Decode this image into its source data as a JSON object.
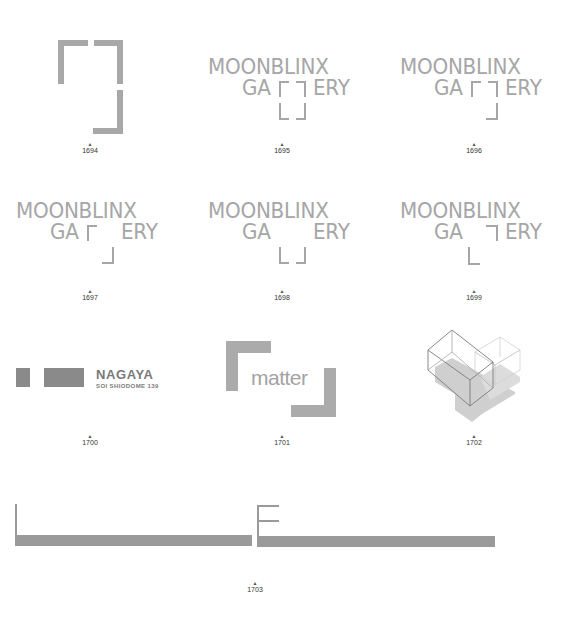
{
  "logos": [
    {
      "id": "1694",
      "caption": "1694",
      "kind": "bracket-frame"
    },
    {
      "id": "1695",
      "caption": "1695",
      "kind": "moonblinx",
      "line1": "MOONBLINX",
      "line2_left": "GA",
      "line2_right": "ERY"
    },
    {
      "id": "1696",
      "caption": "1696",
      "kind": "moonblinx",
      "line1": "MOONBLINX",
      "line2_left": "GA",
      "line2_right": "ERY"
    },
    {
      "id": "1697",
      "caption": "1697",
      "kind": "moonblinx",
      "line1": "MOONBLINX",
      "line2_left": "GA",
      "line2_right": "ERY"
    },
    {
      "id": "1698",
      "caption": "1698",
      "kind": "moonblinx",
      "line1": "MOONBLINX",
      "line2_left": "GA",
      "line2_right": "ERY"
    },
    {
      "id": "1699",
      "caption": "1699",
      "kind": "moonblinx",
      "line1": "MOONBLINX",
      "line2_left": "GA",
      "line2_right": "ERY"
    },
    {
      "id": "1700",
      "caption": "1700",
      "kind": "nagaya",
      "title": "NAGAYA",
      "subtitle": "SOI SHIODOME 139"
    },
    {
      "id": "1701",
      "caption": "1701",
      "kind": "matter",
      "word": "matter"
    },
    {
      "id": "1702",
      "caption": "1702",
      "kind": "isometric-boxes"
    },
    {
      "id": "1703",
      "caption": "1703",
      "kind": "le-bars"
    }
  ],
  "marker_glyph": "▲",
  "colors": {
    "logo_gray": "#a8a8a8",
    "dark_gray": "#7a7a7a",
    "caption": "#333333",
    "background": "#ffffff"
  }
}
